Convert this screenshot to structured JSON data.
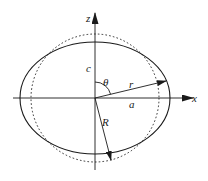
{
  "diagram": {
    "colors": {
      "stroke": "#1a1a1a",
      "background": "#ffffff"
    },
    "axes": {
      "x_label": "x",
      "z_label": "z"
    },
    "labels": {
      "semi_minor": "c",
      "angle": "θ",
      "radius_vector": "r",
      "semi_major": "a",
      "sphere_radius": "R"
    },
    "shapes": {
      "ellipse": {
        "style": "solid",
        "cx": 95,
        "cy": 98,
        "rx": 75,
        "ry": 56
      },
      "circle": {
        "style": "dotted",
        "cx": 95,
        "cy": 98,
        "r": 64
      }
    },
    "vectors": [
      {
        "name": "r",
        "from": [
          95,
          98
        ],
        "to": [
          166,
          81
        ]
      },
      {
        "name": "R",
        "from": [
          95,
          98
        ],
        "to": [
          111,
          160
        ]
      }
    ]
  }
}
